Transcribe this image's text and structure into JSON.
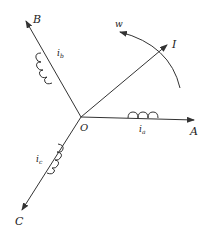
{
  "diagram": {
    "type": "three-phase winding vector diagram",
    "origin_label": "O",
    "axes": [
      {
        "name": "A",
        "current_label": "i",
        "current_sub": "a"
      },
      {
        "name": "B",
        "current_label": "i",
        "current_sub": "b"
      },
      {
        "name": "C",
        "current_label": "i",
        "current_sub": "c"
      }
    ],
    "resultant_label": "I",
    "rotation_label": "w",
    "line_color": "#333333"
  }
}
